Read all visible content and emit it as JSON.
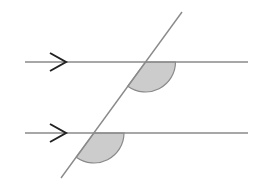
{
  "diagram": {
    "colors": {
      "line": "#8a8a8a",
      "arrow": "#222222",
      "sector_fill": "#cccccc",
      "sector_stroke": "#8a8a8a",
      "background": "#ffffff"
    },
    "parallel_lines": [
      {
        "name": "upper",
        "x1": 25,
        "y1": 62,
        "x2": 248,
        "y2": 62,
        "arrow_tip_x": 66
      },
      {
        "name": "lower",
        "x1": 25,
        "y1": 133,
        "x2": 248,
        "y2": 133,
        "arrow_tip_x": 66
      }
    ],
    "transversal": {
      "x1": 61,
      "y1": 178,
      "x2": 182,
      "y2": 12
    },
    "angle_sectors": [
      {
        "name": "upper-angle",
        "cx": 145.5,
        "cy": 62,
        "r": 30
      },
      {
        "name": "lower-angle",
        "cx": 94,
        "cy": 133,
        "r": 30
      }
    ]
  }
}
